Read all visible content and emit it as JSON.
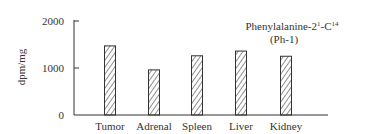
{
  "chart_data": {
    "type": "bar",
    "subtitle": "(Ph-1)",
    "xlabel": "",
    "ylabel": "dpm/mg",
    "ylim": [
      0,
      2000
    ],
    "yticks": [
      0,
      1000,
      2000
    ],
    "ytick_labels": [
      "0",
      "1000",
      "2000"
    ],
    "categories": [
      "Tumor",
      "Adrenal",
      "Spleen",
      "Liver",
      "Kidney"
    ],
    "values": [
      1470,
      960,
      1260,
      1360,
      1250
    ],
    "grid": false,
    "legend": null,
    "bar_fill": "hatched",
    "colors": {
      "ink": "#333333",
      "background": "#ffffff"
    }
  },
  "annotation": {
    "line1_main": "Phenylalanine-2",
    "line1_sup1": "1",
    "line1_mid": "-C",
    "line1_sup2": "14",
    "line2": "(Ph-1)"
  }
}
